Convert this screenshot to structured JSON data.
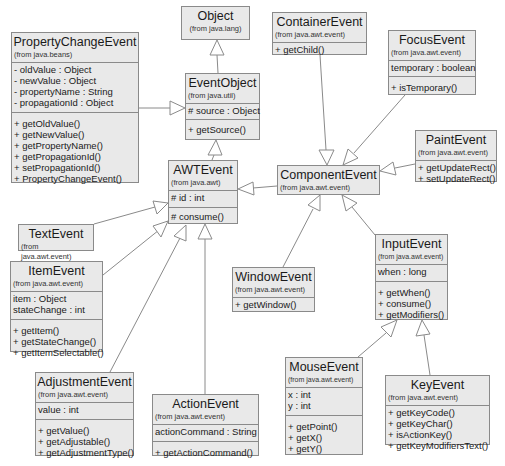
{
  "classes": {
    "object": {
      "name": "Object",
      "package": "(from java.lang)",
      "attributes": [],
      "methods": []
    },
    "propertyChangeEvent": {
      "name": "PropertyChangeEvent",
      "package": "(from java.beans)",
      "attributes": [
        "- oldValue : Object",
        "- newValue : Object",
        "- propertyName : String",
        "- propagationId : Object"
      ],
      "methods": [
        "+ getOldValue()",
        "+ getNewValue()",
        "+ getPropertyName()",
        "+ getPropagationId()",
        "+ setPropagationId()",
        "+ PropertyChangeEvent()"
      ]
    },
    "eventObject": {
      "name": "EventObject",
      "package": "(from java.util)",
      "attributes": [
        "# source : Object"
      ],
      "methods": [
        "+ getSource()"
      ]
    },
    "containerEvent": {
      "name": "ContainerEvent",
      "package": "(from java.awt.event)",
      "attributes": [],
      "methods": [
        "+ getChild()"
      ]
    },
    "focusEvent": {
      "name": "FocusEvent",
      "package": "(from java.awt.event)",
      "attributes": [
        "temporary : boolean"
      ],
      "methods": [
        "+ isTemporary()"
      ]
    },
    "awtEvent": {
      "name": "AWTEvent",
      "package": "(from java.awt)",
      "attributes": [
        "# id : int"
      ],
      "methods": [
        "# consume()"
      ]
    },
    "componentEvent": {
      "name": "ComponentEvent",
      "package": "(from java.awt.event)",
      "attributes": [],
      "methods": []
    },
    "paintEvent": {
      "name": "PaintEvent",
      "package": "(from java.awt.event)",
      "attributes": [],
      "methods": [
        "+ getUpdateRect()",
        "+ setUpdateRect()"
      ]
    },
    "textEvent": {
      "name": "TextEvent",
      "package": "(from java.awt.event)",
      "attributes": [],
      "methods": []
    },
    "itemEvent": {
      "name": "ItemEvent",
      "package": "(from java.awt.event)",
      "attributes": [
        "item : Object",
        "stateChange : int"
      ],
      "methods": [
        "+ getItem()",
        "+ getStateChange()",
        "+ getItemSelectable()"
      ]
    },
    "windowEvent": {
      "name": "WindowEvent",
      "package": "(from java.awt.event)",
      "attributes": [],
      "methods": [
        "+ getWindow()"
      ]
    },
    "inputEvent": {
      "name": "InputEvent",
      "package": "(from java.awt.event)",
      "attributes": [
        "when : long"
      ],
      "methods": [
        "+ getWhen()",
        "+ consume()",
        "+ getModifiers()"
      ]
    },
    "adjustmentEvent": {
      "name": "AdjustmentEvent",
      "package": "(from java.awt.event)",
      "attributes": [
        "value : int"
      ],
      "methods": [
        "+ getValue()",
        "+ getAdjustable()",
        "+ getAdjustmentType()"
      ]
    },
    "actionEvent": {
      "name": "ActionEvent",
      "package": "(from java.awt.event)",
      "attributes": [
        "actionCommand : String"
      ],
      "methods": [
        "+ getActionCommand()"
      ]
    },
    "mouseEvent": {
      "name": "MouseEvent",
      "package": "(from java.awt.event)",
      "attributes": [
        "x : int",
        "y : int"
      ],
      "methods": [
        "+ getPoint()",
        "+ getX()",
        "+ getY()"
      ]
    },
    "keyEvent": {
      "name": "KeyEvent",
      "package": "(from java.awt.event)",
      "attributes": [],
      "methods": [
        "+ getKeyCode()",
        "+ getKeyChar()",
        "+ isActionKey()",
        "+ getKeyModifiersText()"
      ]
    }
  },
  "relationships": [
    {
      "from": "EventObject",
      "to": "Object",
      "type": "generalization"
    },
    {
      "from": "PropertyChangeEvent",
      "to": "EventObject",
      "type": "generalization"
    },
    {
      "from": "AWTEvent",
      "to": "EventObject",
      "type": "generalization"
    },
    {
      "from": "ComponentEvent",
      "to": "AWTEvent",
      "type": "generalization"
    },
    {
      "from": "ContainerEvent",
      "to": "ComponentEvent",
      "type": "generalization"
    },
    {
      "from": "FocusEvent",
      "to": "ComponentEvent",
      "type": "generalization"
    },
    {
      "from": "PaintEvent",
      "to": "ComponentEvent",
      "type": "generalization"
    },
    {
      "from": "WindowEvent",
      "to": "ComponentEvent",
      "type": "generalization"
    },
    {
      "from": "InputEvent",
      "to": "ComponentEvent",
      "type": "generalization"
    },
    {
      "from": "MouseEvent",
      "to": "InputEvent",
      "type": "generalization"
    },
    {
      "from": "KeyEvent",
      "to": "InputEvent",
      "type": "generalization"
    },
    {
      "from": "TextEvent",
      "to": "AWTEvent",
      "type": "generalization"
    },
    {
      "from": "ItemEvent",
      "to": "AWTEvent",
      "type": "generalization"
    },
    {
      "from": "AdjustmentEvent",
      "to": "AWTEvent",
      "type": "generalization"
    },
    {
      "from": "ActionEvent",
      "to": "AWTEvent",
      "type": "generalization"
    }
  ],
  "colors": {
    "box_fill": "#e9e9e9",
    "box_border": "#8a8a8a",
    "line": "#8a8a8a",
    "background": "#ffffff"
  }
}
